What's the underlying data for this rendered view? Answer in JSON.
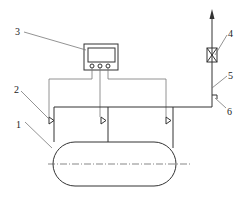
{
  "diagram": {
    "type": "schematic",
    "labels": [
      {
        "id": "1",
        "text": "1",
        "refers_to": "vessel"
      },
      {
        "id": "2",
        "text": "2",
        "refers_to": "sensor"
      },
      {
        "id": "3",
        "text": "3",
        "refers_to": "monitor"
      },
      {
        "id": "4",
        "text": "4",
        "refers_to": "valve"
      },
      {
        "id": "5",
        "text": "5",
        "refers_to": "outlet-pipe"
      },
      {
        "id": "6",
        "text": "6",
        "refers_to": "fitting"
      }
    ],
    "colors": {
      "line": "#333333",
      "background": "#ffffff"
    }
  }
}
